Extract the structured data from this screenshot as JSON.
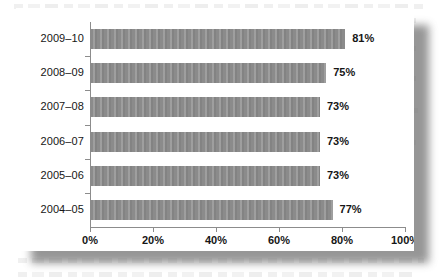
{
  "chart_data": {
    "type": "bar",
    "orientation": "horizontal",
    "title": "",
    "xlabel": "",
    "ylabel": "",
    "categories": [
      "2009–10",
      "2008–09",
      "2007–08",
      "2006–07",
      "2005–06",
      "2004–05"
    ],
    "values": [
      81,
      75,
      73,
      73,
      73,
      77
    ],
    "value_labels": [
      "81%",
      "75%",
      "73%",
      "73%",
      "73%",
      "77%"
    ],
    "xlim": [
      0,
      100
    ],
    "xticks": [
      0,
      20,
      40,
      60,
      80,
      100
    ],
    "xtick_labels": [
      "0%",
      "20%",
      "40%",
      "60%",
      "80%",
      "100%"
    ],
    "grid": false,
    "legend": null,
    "bar_color": "#8b8b8b",
    "axis_color": "#8c8c8c",
    "text_color": "#161616",
    "background_color": "#ffffff"
  }
}
